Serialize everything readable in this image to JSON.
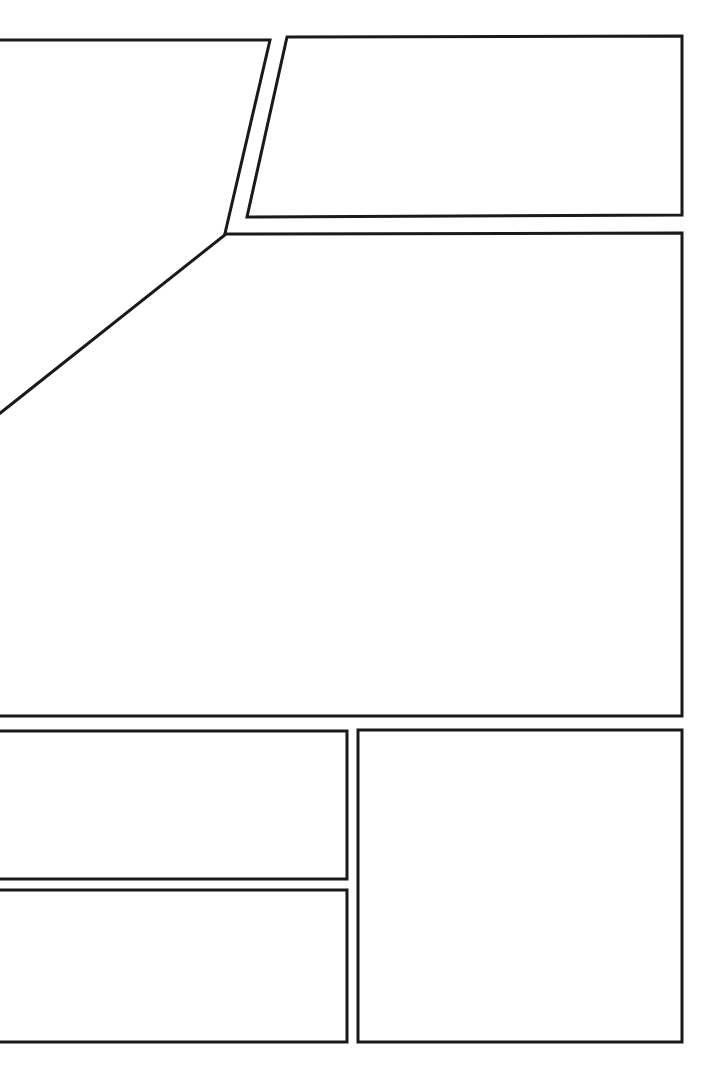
{
  "page": {
    "kind": "comic-page-layout",
    "title": "",
    "width": 722,
    "height": 1078,
    "background_color": "#ffffff",
    "border_color": "#1a1a1a",
    "border_width": 3,
    "gutter_color": "#ffffff"
  },
  "panels": [
    {
      "id": "panel-1",
      "name": "top-left-slanted-panel",
      "label": "",
      "shape": "quadrilateral",
      "points": "-6,40 270,40 183,414 -6,417",
      "row": 1,
      "column": 1
    },
    {
      "id": "panel-2",
      "name": "top-right-panel",
      "label": "",
      "shape": "quadrilateral",
      "points": "287,37 682,36 682,215 247,217",
      "row": 1,
      "column": 2
    },
    {
      "id": "panel-3",
      "name": "large-middle-panel",
      "label": "",
      "shape": "quadrilateral",
      "points": "226,234 682,233 682,716 -6,716 -6,418",
      "row": 2,
      "column": 1
    },
    {
      "id": "panel-4",
      "name": "bottom-left-upper-panel",
      "label": "",
      "shape": "rectangle",
      "points": "-6,731 347,731 347,879 -6,879",
      "row": 3,
      "column": 1
    },
    {
      "id": "panel-5",
      "name": "bottom-left-lower-panel",
      "label": "",
      "shape": "rectangle",
      "points": "-6,890 347,890 347,1042 -6,1042",
      "row": 4,
      "column": 1
    },
    {
      "id": "panel-6",
      "name": "bottom-right-panel",
      "label": "",
      "shape": "rectangle",
      "points": "358,730 682,730 682,1042 358,1042",
      "row": 3,
      "column": 2
    }
  ]
}
